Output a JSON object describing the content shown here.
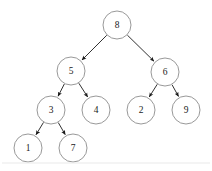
{
  "diagram": {
    "background_color": "#ffffff",
    "node_fill": "#ffffff",
    "node_stroke": "#8d8d8d",
    "edge_color": "#1a1a1a",
    "label_color": "#1a1a1a",
    "node_radius": 14
  },
  "chart_data": {
    "type": "diagram",
    "nodes": [
      {
        "id": "n8",
        "label": "8",
        "x": 117,
        "y": 25,
        "level": 0
      },
      {
        "id": "n5",
        "label": "5",
        "x": 71,
        "y": 71,
        "level": 1
      },
      {
        "id": "n6",
        "label": "6",
        "x": 165,
        "y": 72,
        "level": 1
      },
      {
        "id": "n3",
        "label": "3",
        "x": 51,
        "y": 110,
        "level": 2
      },
      {
        "id": "n4",
        "label": "4",
        "x": 96,
        "y": 110,
        "level": 2
      },
      {
        "id": "n2",
        "label": "2",
        "x": 141,
        "y": 110,
        "level": 2
      },
      {
        "id": "n9",
        "label": "9",
        "x": 186,
        "y": 110,
        "level": 2
      },
      {
        "id": "n1",
        "label": "1",
        "x": 28,
        "y": 148,
        "level": 3
      },
      {
        "id": "n7",
        "label": "7",
        "x": 73,
        "y": 148,
        "level": 3
      }
    ],
    "edges": [
      {
        "from": "n8",
        "to": "n5",
        "directed": true
      },
      {
        "from": "n8",
        "to": "n6",
        "directed": true
      },
      {
        "from": "n5",
        "to": "n3",
        "directed": true
      },
      {
        "from": "n5",
        "to": "n4",
        "directed": true
      },
      {
        "from": "n6",
        "to": "n2",
        "directed": true
      },
      {
        "from": "n6",
        "to": "n9",
        "directed": true
      },
      {
        "from": "n3",
        "to": "n1",
        "directed": true
      },
      {
        "from": "n3",
        "to": "n7",
        "directed": true
      }
    ]
  },
  "footer": {
    "rule_visible": true,
    "rule_y": 163
  }
}
